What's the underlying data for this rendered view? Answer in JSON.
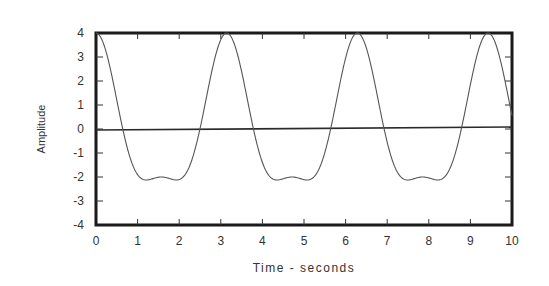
{
  "chart_data": {
    "type": "line",
    "title": "",
    "xlabel": "Time - seconds",
    "ylabel": "Amplitude",
    "xlim": [
      0,
      10
    ],
    "ylim": [
      -4,
      4
    ],
    "x_ticks": [
      0,
      1,
      2,
      3,
      4,
      5,
      6,
      7,
      8,
      9,
      10
    ],
    "y_ticks": [
      4,
      3,
      2,
      1,
      0,
      -1,
      -2,
      -3,
      -4
    ],
    "grid": false,
    "legend": null,
    "zero_line": true,
    "series": [
      {
        "name": "signal",
        "description": "Periodic waveform, period ~3.14 s; peaks at 4, troughs ~-2.1 with small local max -2 at mid-trough",
        "formula": "3*cos(2t) + cos(4t)",
        "x": [
          0,
          0.25,
          0.5,
          0.64,
          0.75,
          1.0,
          1.2,
          1.3,
          1.57,
          1.84,
          2.0,
          2.25,
          2.5,
          2.75,
          3.0,
          3.14,
          3.5,
          4.0,
          4.5,
          4.71,
          5.0,
          5.5,
          6.0,
          6.28,
          6.5,
          7.0,
          7.5,
          7.85,
          8.0,
          8.5,
          9.0,
          9.42,
          9.75,
          10.0
        ],
        "values": [
          4.0,
          3.05,
          1.04,
          0.0,
          -0.52,
          -1.9,
          -2.12,
          -2.12,
          -2.0,
          -2.12,
          -2.11,
          -1.76,
          -0.26,
          1.57,
          3.7,
          4.0,
          2.8,
          -0.58,
          -2.1,
          -2.0,
          -2.09,
          -1.6,
          3.06,
          4.0,
          3.58,
          0.74,
          -2.1,
          -2.0,
          -2.05,
          -1.32,
          2.0,
          4.0,
          2.93,
          1.07
        ]
      }
    ]
  }
}
